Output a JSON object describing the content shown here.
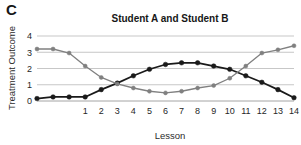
{
  "panel": {
    "label": "C"
  },
  "chart_data": {
    "type": "line",
    "title": "Student A and Student B",
    "xlabel": "Lesson",
    "ylabel": "Treatment Outcome",
    "grid": true,
    "legend": "none",
    "xlim": [
      -2,
      14
    ],
    "ylim": [
      0,
      4
    ],
    "yticks": [
      0,
      1,
      2,
      3,
      4
    ],
    "ytick_labels": [
      "0",
      "1",
      "2",
      "3",
      "4"
    ],
    "xticks": [
      1,
      2,
      3,
      4,
      5,
      6,
      7,
      8,
      9,
      10,
      11,
      12,
      13,
      14
    ],
    "xtick_labels": [
      "1",
      "2",
      "3",
      "4",
      "5",
      "6",
      "7",
      "8",
      "9",
      "10",
      "11",
      "12",
      "13",
      "14"
    ],
    "x": [
      -2,
      -1,
      0,
      1,
      2,
      3,
      4,
      5,
      6,
      7,
      8,
      9,
      10,
      11,
      12,
      13,
      14
    ],
    "series": [
      {
        "name": "Student A",
        "color": "#1a1a1a",
        "marker": "circle",
        "values": [
          0.15,
          0.25,
          0.25,
          0.25,
          0.7,
          1.1,
          1.55,
          1.95,
          2.25,
          2.35,
          2.35,
          2.15,
          1.95,
          1.55,
          1.15,
          0.7,
          0.2
        ]
      },
      {
        "name": "Student B",
        "color": "#808080",
        "marker": "circle",
        "values": [
          3.2,
          3.2,
          2.95,
          2.15,
          1.45,
          1.05,
          0.8,
          0.6,
          0.5,
          0.6,
          0.8,
          0.95,
          1.4,
          2.15,
          2.95,
          3.15,
          3.4
        ]
      }
    ]
  }
}
